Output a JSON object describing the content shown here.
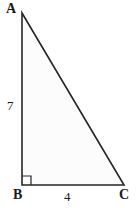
{
  "figure": {
    "type": "right-triangle",
    "background_color": "#ffffff",
    "stroke_color": "#262626",
    "fill_color": "#fcfcfc",
    "stroke_width": 1.6,
    "vertices": [
      {
        "name": "A",
        "label": "A",
        "x": 22,
        "y": 13
      },
      {
        "name": "B",
        "label": "B",
        "x": 22,
        "y": 185
      },
      {
        "name": "C",
        "label": "C",
        "x": 124,
        "y": 185
      }
    ],
    "right_angle": {
      "at_vertex": "B",
      "marker": "square",
      "size": 9
    },
    "side_labels": [
      {
        "name": "leg-ab",
        "side": "AB",
        "label": "7"
      },
      {
        "name": "leg-bc",
        "side": "BC",
        "label": "4"
      }
    ]
  }
}
